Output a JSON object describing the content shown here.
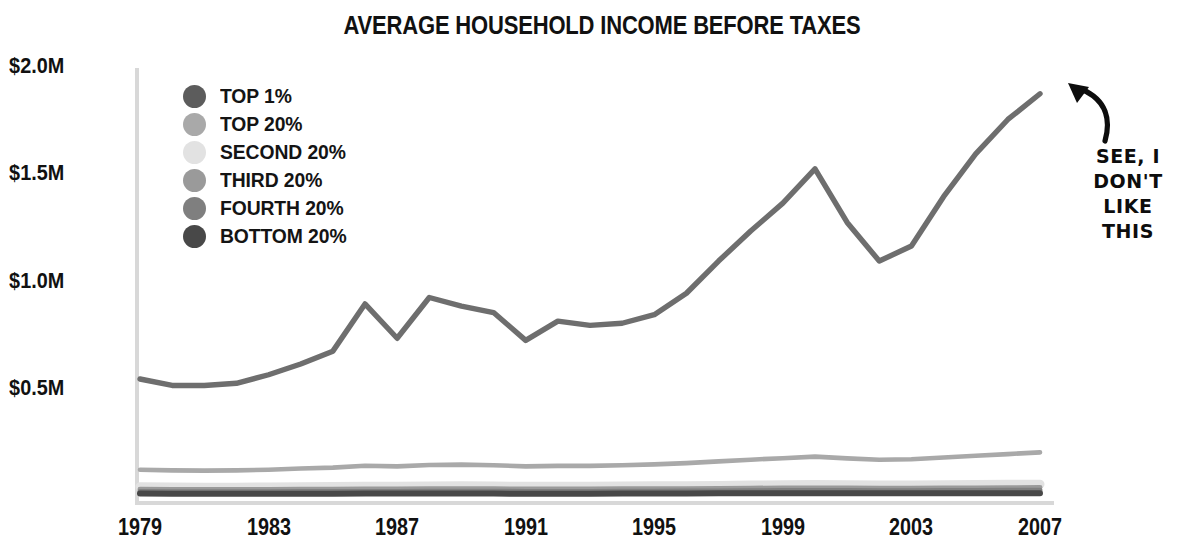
{
  "title": "AVERAGE HOUSEHOLD INCOME BEFORE TAXES",
  "legend": {
    "items": [
      {
        "label": "TOP 1%",
        "color": "#5c5c5c"
      },
      {
        "label": "TOP 20%",
        "color": "#a9a9a9"
      },
      {
        "label": "SECOND 20%",
        "color": "#e2e2e2"
      },
      {
        "label": "THIRD 20%",
        "color": "#9a9a9a"
      },
      {
        "label": "FOURTH 20%",
        "color": "#7f7f7f"
      },
      {
        "label": "BOTTOM 20%",
        "color": "#484848"
      }
    ]
  },
  "annotation": {
    "lines": [
      "SEE, I",
      "DON'T",
      "LIKE",
      "THIS"
    ],
    "arrow": "curved-arrow-up-left",
    "color": "#0d0d0d"
  },
  "axes": {
    "y_ticks": [
      "$2.0M",
      "$1.5M",
      "$1.0M",
      "$0.5M"
    ],
    "x_ticks": [
      "1979",
      "1983",
      "1987",
      "1991",
      "1995",
      "1999",
      "2003",
      "2007"
    ],
    "axis_color": "#d8d8d8"
  },
  "chart_data": {
    "type": "line",
    "title": "AVERAGE HOUSEHOLD INCOME BEFORE TAXES",
    "xlabel": "",
    "ylabel": "",
    "ylim": [
      0,
      2.0
    ],
    "y_unit": "millions of dollars",
    "xlim": [
      1979,
      2007
    ],
    "grid": false,
    "legend_position": "upper-left-inside",
    "y_tick_values": [
      2.0,
      1.5,
      1.0,
      0.5
    ],
    "y_tick_labels": [
      "$2.0M",
      "$1.5M",
      "$1.0M",
      "$0.5M"
    ],
    "x_tick_values": [
      1979,
      1983,
      1987,
      1991,
      1995,
      1999,
      2003,
      2007
    ],
    "x_tick_labels": [
      "1979",
      "1983",
      "1987",
      "1991",
      "1995",
      "1999",
      "2003",
      "2007"
    ],
    "x": [
      1979,
      1980,
      1981,
      1982,
      1983,
      1984,
      1985,
      1986,
      1987,
      1988,
      1989,
      1990,
      1991,
      1992,
      1993,
      1994,
      1995,
      1996,
      1997,
      1998,
      1999,
      2000,
      2001,
      2002,
      2003,
      2004,
      2005,
      2006,
      2007
    ],
    "series": [
      {
        "name": "TOP 1%",
        "color": "#6e6e6e",
        "values": [
          0.55,
          0.52,
          0.52,
          0.53,
          0.57,
          0.62,
          0.68,
          0.9,
          0.74,
          0.93,
          0.89,
          0.86,
          0.73,
          0.82,
          0.8,
          0.81,
          0.85,
          0.95,
          1.1,
          1.24,
          1.37,
          1.53,
          1.28,
          1.1,
          1.17,
          1.4,
          1.6,
          1.76,
          1.88
        ]
      },
      {
        "name": "TOP 20%",
        "color": "#a9a9a9",
        "values": [
          0.127,
          0.124,
          0.123,
          0.124,
          0.127,
          0.133,
          0.137,
          0.146,
          0.143,
          0.149,
          0.151,
          0.148,
          0.143,
          0.145,
          0.145,
          0.148,
          0.152,
          0.158,
          0.166,
          0.174,
          0.181,
          0.188,
          0.18,
          0.174,
          0.176,
          0.184,
          0.192,
          0.2,
          0.208
        ]
      },
      {
        "name": "SECOND 20%",
        "color": "#e2e2e2",
        "values": [
          0.048,
          0.047,
          0.046,
          0.046,
          0.047,
          0.048,
          0.049,
          0.05,
          0.05,
          0.051,
          0.052,
          0.051,
          0.05,
          0.05,
          0.05,
          0.051,
          0.052,
          0.053,
          0.054,
          0.056,
          0.057,
          0.058,
          0.057,
          0.056,
          0.056,
          0.057,
          0.058,
          0.059,
          0.06
        ]
      },
      {
        "name": "THIRD 20%",
        "color": "#9a9a9a",
        "values": [
          0.036,
          0.035,
          0.035,
          0.035,
          0.035,
          0.036,
          0.036,
          0.037,
          0.037,
          0.038,
          0.038,
          0.038,
          0.037,
          0.037,
          0.037,
          0.038,
          0.038,
          0.039,
          0.04,
          0.041,
          0.042,
          0.042,
          0.042,
          0.041,
          0.041,
          0.042,
          0.042,
          0.043,
          0.044
        ]
      },
      {
        "name": "FOURTH 20%",
        "color": "#7f7f7f",
        "values": [
          0.026,
          0.025,
          0.025,
          0.025,
          0.025,
          0.026,
          0.026,
          0.026,
          0.026,
          0.027,
          0.027,
          0.027,
          0.026,
          0.026,
          0.026,
          0.027,
          0.027,
          0.028,
          0.028,
          0.029,
          0.03,
          0.03,
          0.03,
          0.029,
          0.029,
          0.03,
          0.03,
          0.031,
          0.031
        ]
      },
      {
        "name": "BOTTOM 20%",
        "color": "#484848",
        "values": [
          0.016,
          0.015,
          0.015,
          0.015,
          0.015,
          0.015,
          0.015,
          0.016,
          0.016,
          0.016,
          0.016,
          0.016,
          0.015,
          0.015,
          0.015,
          0.016,
          0.016,
          0.016,
          0.017,
          0.017,
          0.018,
          0.018,
          0.017,
          0.017,
          0.017,
          0.017,
          0.018,
          0.018,
          0.018
        ]
      }
    ]
  }
}
